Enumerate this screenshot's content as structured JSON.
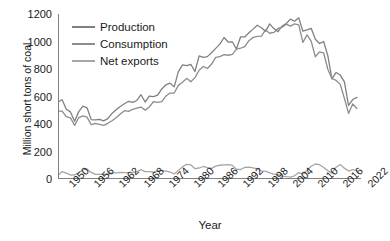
{
  "chart_data": {
    "type": "line",
    "title": "",
    "xlabel": "Year",
    "ylabel": "Million short tons of coal",
    "xlim": [
      1950,
      2023
    ],
    "ylim": [
      0,
      1200
    ],
    "ytick_step": 200,
    "yticks": [
      0,
      200,
      400,
      600,
      800,
      1000,
      1200
    ],
    "xticks": [
      1950,
      1956,
      1962,
      1968,
      1974,
      1980,
      1986,
      1992,
      1998,
      2004,
      2010,
      2016,
      2022
    ],
    "xtick_labels": [
      "1950",
      "1956",
      "1962",
      "1968",
      "1974",
      "1980",
      "1986",
      "1992",
      "1998",
      "2004",
      "2010",
      "2016",
      "2022"
    ],
    "grid": false,
    "legend_position": "upper-left-inside",
    "x": [
      1950,
      1951,
      1952,
      1953,
      1954,
      1955,
      1956,
      1957,
      1958,
      1959,
      1960,
      1961,
      1962,
      1963,
      1964,
      1965,
      1966,
      1967,
      1968,
      1969,
      1970,
      1971,
      1972,
      1973,
      1974,
      1975,
      1976,
      1977,
      1978,
      1979,
      1980,
      1981,
      1982,
      1983,
      1984,
      1985,
      1986,
      1987,
      1988,
      1989,
      1990,
      1991,
      1992,
      1993,
      1994,
      1995,
      1996,
      1997,
      1998,
      1999,
      2000,
      2001,
      2002,
      2003,
      2004,
      2005,
      2006,
      2007,
      2008,
      2009,
      2010,
      2011,
      2012,
      2013,
      2014,
      2015,
      2016,
      2017,
      2018,
      2019,
      2020,
      2021,
      2022
    ],
    "series": [
      {
        "name": "Production",
        "color": "#808080",
        "values": [
          560,
          576,
          507,
          488,
          420,
          490,
          530,
          518,
          432,
          430,
          434,
          423,
          439,
          477,
          504,
          527,
          547,
          565,
          557,
          571,
          613,
          560,
          602,
          599,
          610,
          655,
          685,
          697,
          670,
          781,
          830,
          824,
          834,
          782,
          896,
          884,
          890,
          918,
          950,
          981,
          1029,
          996,
          998,
          945,
          1034,
          1033,
          1064,
          1090,
          1118,
          1100,
          1074,
          1128,
          1094,
          1072,
          1112,
          1131,
          1163,
          1147,
          1172,
          1075,
          1084,
          1096,
          1016,
          985,
          1000,
          897,
          728,
          775,
          756,
          706,
          535,
          578,
          594
        ],
        "marker": "none",
        "linewidth": 1.3
      },
      {
        "name": "Consumption",
        "color": "#8c8c8c",
        "values": [
          494,
          494,
          454,
          445,
          390,
          447,
          459,
          450,
          395,
          404,
          398,
          390,
          405,
          424,
          446,
          472,
          497,
          492,
          507,
          516,
          523,
          501,
          524,
          562,
          558,
          563,
          603,
          625,
          625,
          681,
          703,
          732,
          707,
          737,
          791,
          818,
          804,
          836,
          884,
          890,
          904,
          900,
          907,
          944,
          951,
          962,
          1006,
          1030,
          1037,
          1039,
          1084,
          1060,
          1066,
          1095,
          1104,
          1126,
          1112,
          1128,
          1121,
          994,
          1048,
          1003,
          889,
          924,
          918,
          798,
          731,
          717,
          688,
          587,
          477,
          546,
          513
        ],
        "marker": "none",
        "linewidth": 1.3
      },
      {
        "name": "Net exports",
        "color": "#a6a6a6",
        "values": [
          27,
          54,
          42,
          29,
          30,
          45,
          66,
          73,
          48,
          34,
          34,
          33,
          35,
          44,
          45,
          48,
          46,
          46,
          48,
          53,
          68,
          54,
          54,
          50,
          57,
          63,
          57,
          51,
          37,
          62,
          88,
          107,
          103,
          75,
          80,
          91,
          82,
          77,
          94,
          100,
          103,
          105,
          99,
          71,
          69,
          85,
          87,
          81,
          74,
          57,
          57,
          44,
          35,
          31,
          21,
          17,
          14,
          23,
          47,
          35,
          62,
          93,
          109,
          104,
          83,
          61,
          43,
          86,
          105,
          79,
          58,
          69,
          61
        ],
        "marker": "none",
        "linewidth": 1.3
      }
    ]
  },
  "legend": {
    "items": [
      {
        "label": "Production"
      },
      {
        "label": "Consumption"
      },
      {
        "label": "Net exports"
      }
    ]
  },
  "axes": {
    "x_title": "Year",
    "y_title": "Million short tons of coal"
  }
}
